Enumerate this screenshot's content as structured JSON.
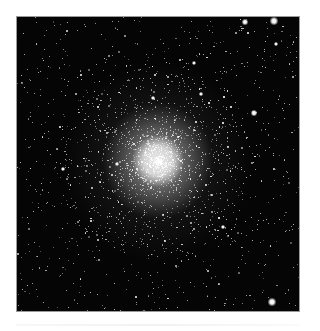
{
  "image": {
    "subject": "globular-star-cluster",
    "alt": "Dense globular star cluster with bright white core surrounded by scattered stars on black sky",
    "colors": {
      "background": "#ffffff",
      "sky": "#050505",
      "frame_border": "#9a9a9a",
      "core": "#ebebeb"
    },
    "frame": {
      "x": 16,
      "y": 16,
      "width": 284,
      "height": 296
    },
    "core_center": {
      "x": 157,
      "y": 160
    },
    "bright_stars": [
      {
        "x": 273,
        "y": 20,
        "r": 3
      },
      {
        "x": 244,
        "y": 21,
        "r": 2
      },
      {
        "x": 275,
        "y": 43,
        "r": 1.6
      },
      {
        "x": 253,
        "y": 112,
        "r": 2.2
      },
      {
        "x": 271,
        "y": 301,
        "r": 3
      },
      {
        "x": 143,
        "y": 311,
        "r": 1.8
      },
      {
        "x": 193,
        "y": 62,
        "r": 1.6
      },
      {
        "x": 152,
        "y": 97,
        "r": 1.4
      },
      {
        "x": 200,
        "y": 93,
        "r": 1.4
      },
      {
        "x": 62,
        "y": 168,
        "r": 1.4
      },
      {
        "x": 222,
        "y": 226,
        "r": 1.4
      },
      {
        "x": 116,
        "y": 163,
        "r": 1.3
      }
    ]
  }
}
